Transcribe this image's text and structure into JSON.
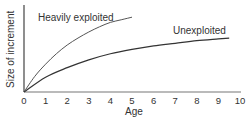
{
  "chart_data": {
    "type": "line",
    "title": "",
    "xlabel": "Age",
    "ylabel": "Size of increment",
    "xlim": [
      0,
      10
    ],
    "ylim": [
      0,
      100
    ],
    "x_ticks": [
      "0",
      "1",
      "2",
      "3",
      "4",
      "5",
      "6",
      "7",
      "8",
      "9",
      "10"
    ],
    "y_ticks": [],
    "grid": false,
    "legend": "inline annotations",
    "series": [
      {
        "name": "Heavily exploited",
        "x": [
          0,
          0.5,
          1,
          1.5,
          2,
          2.5,
          3,
          3.5,
          4,
          4.5,
          5
        ],
        "y": [
          0,
          18,
          32,
          44,
          54,
          62,
          69,
          75,
          80,
          83,
          86
        ]
      },
      {
        "name": "Unexploited",
        "x": [
          0,
          1,
          2,
          3,
          4,
          5,
          6,
          7,
          8,
          9,
          9.5
        ],
        "y": [
          0,
          17,
          28,
          37,
          44,
          49,
          53,
          56,
          59,
          61,
          62
        ]
      }
    ]
  },
  "labels": {
    "ylabel": "Size of increment",
    "xlabel": "Age",
    "series_heavy": "Heavily exploited",
    "series_unexploited": "Unexploited",
    "ticks": [
      "0",
      "1",
      "2",
      "3",
      "4",
      "5",
      "6",
      "7",
      "8",
      "9",
      "10"
    ]
  },
  "colors": {
    "axis": "#444444",
    "heavy": "#555555",
    "unexploited": "#333333",
    "text": "#333333"
  }
}
